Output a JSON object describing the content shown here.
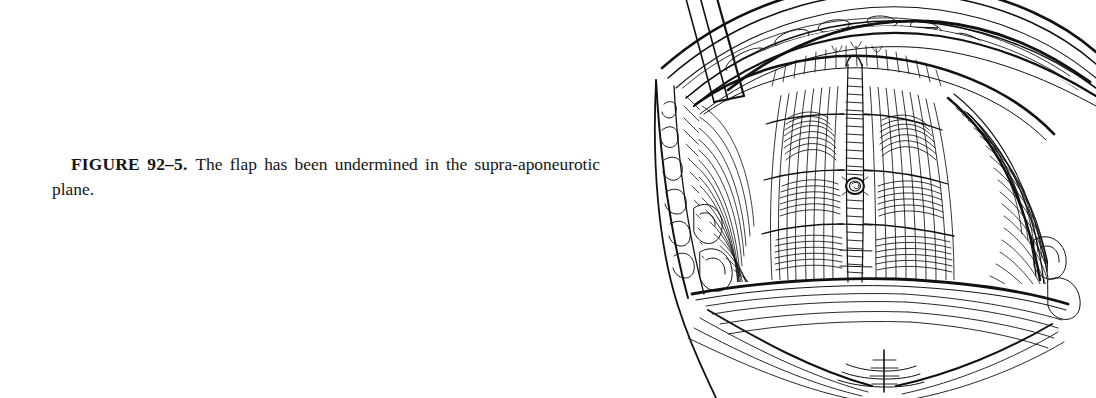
{
  "page": {
    "background_color": "#ffffff",
    "ink_color": "#111111",
    "width": 1083,
    "height": 392
  },
  "caption": {
    "figure_label": "FIGURE 92–5.",
    "figure_number": "92–5",
    "text": "The flap has been undermined in the supra-aponeurotic plane.",
    "full_text": "FIGURE 92–5.  The flap has been undermined in the supra-aponeurotic plane.",
    "alignment": "justified",
    "font_style": "serif",
    "label_weight": "bold"
  },
  "illustration": {
    "name": "abdominoplasty-flap-undermining-illustration",
    "medium": "pen-and-ink line drawing",
    "title": "Abdominal flap undermined in the supra-aponeurotic plane",
    "ink_color": "#111111",
    "position": "right",
    "bleeds_off_right_edge": true,
    "parts": [
      {
        "name": "elevated-skin-flap",
        "label": "Elevated abdominal skin flap (retracted superiorly)"
      },
      {
        "name": "flap-undersurface-fat",
        "label": "Undersurface of flap showing subcutaneous fat"
      },
      {
        "name": "rectus-abdominis-left",
        "label": "Left rectus abdominis muscle through anterior sheath"
      },
      {
        "name": "rectus-abdominis-right",
        "label": "Right rectus abdominis muscle through anterior sheath"
      },
      {
        "name": "linea-alba",
        "label": "Linea alba (midline raphe)"
      },
      {
        "name": "tendinous-inscriptions",
        "label": "Tendinous inscriptions"
      },
      {
        "name": "umbilicus",
        "label": "Umbilicus"
      },
      {
        "name": "external-oblique-aponeurosis",
        "label": "External oblique aponeurosis"
      },
      {
        "name": "cut-edge-fat-lobules",
        "label": "Cut edge of flap showing fat lobules"
      },
      {
        "name": "retractor-instrument",
        "label": "Retractor blade entering from upper left"
      },
      {
        "name": "inguinal-crease",
        "label": "Inguinal crease / lower abdominal fold"
      },
      {
        "name": "suprapubic-midline-marker",
        "label": "Suprapubic midline marking"
      },
      {
        "name": "flank-contour-left",
        "label": "Left flank body contour"
      }
    ]
  }
}
